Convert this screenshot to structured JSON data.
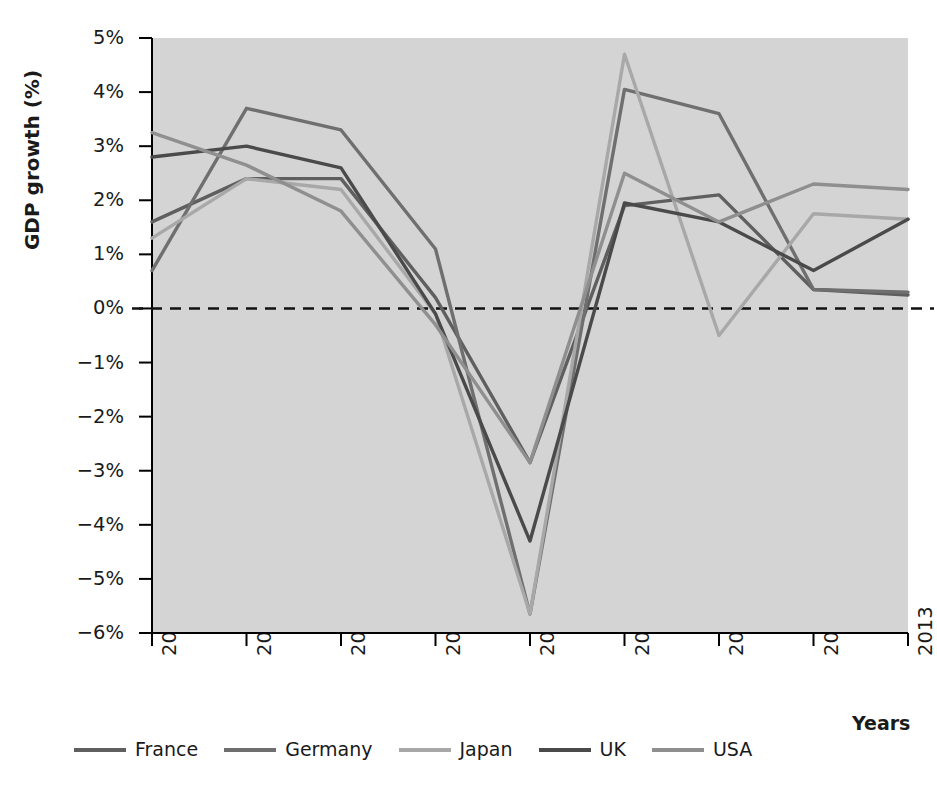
{
  "chart_data": {
    "type": "line",
    "title": "",
    "xlabel": "Years",
    "ylabel": "GDP growth (%)",
    "categories": [
      "2005",
      "2006",
      "2007",
      "2008",
      "2009",
      "2010",
      "2011",
      "2012",
      "2013"
    ],
    "x": [
      2005,
      2006,
      2007,
      2008,
      2009,
      2010,
      2011,
      2012,
      2013
    ],
    "xlim": [
      2005,
      2013
    ],
    "ylim": [
      -6,
      5
    ],
    "yticks": [
      "5%",
      "4%",
      "3%",
      "2%",
      "1%",
      "0%",
      "−1%",
      "−2%",
      "−3%",
      "−4%",
      "−5%",
      "−6%"
    ],
    "ytick_values": [
      5,
      4,
      3,
      2,
      1,
      0,
      -1,
      -2,
      -3,
      -4,
      -5,
      -6
    ],
    "grid": false,
    "zero_line": true,
    "zero_line_style": "dashed",
    "legend_position": "bottom",
    "plot_background": "#d4d4d4",
    "series": [
      {
        "name": "France",
        "color": "#5f5f5f",
        "values": [
          1.6,
          2.4,
          2.4,
          0.2,
          -2.85,
          1.9,
          2.1,
          0.35,
          0.25
        ]
      },
      {
        "name": "Germany",
        "color": "#6f6f6f",
        "values": [
          0.7,
          3.7,
          3.3,
          1.1,
          -5.65,
          4.05,
          3.6,
          0.35,
          0.3
        ]
      },
      {
        "name": "Japan",
        "color": "#a8a8a8",
        "values": [
          1.3,
          2.4,
          2.2,
          -0.1,
          -5.65,
          4.7,
          -0.5,
          1.75,
          1.65
        ]
      },
      {
        "name": "UK",
        "color": "#4a4a4a",
        "values": [
          2.8,
          3.0,
          2.6,
          -0.1,
          -4.3,
          1.95,
          1.6,
          0.7,
          1.65
        ]
      },
      {
        "name": "USA",
        "color": "#8f8f8f",
        "values": [
          3.25,
          2.65,
          1.8,
          -0.3,
          -2.85,
          2.5,
          1.6,
          2.3,
          2.2
        ]
      }
    ]
  },
  "axis": {
    "y_title": "GDP growth (%)",
    "x_title": "Years"
  },
  "legend": {
    "items": [
      {
        "label": "France",
        "color": "#5f5f5f"
      },
      {
        "label": "Germany",
        "color": "#6f6f6f"
      },
      {
        "label": "Japan",
        "color": "#a8a8a8"
      },
      {
        "label": "UK",
        "color": "#4a4a4a"
      },
      {
        "label": "USA",
        "color": "#8f8f8f"
      }
    ]
  }
}
